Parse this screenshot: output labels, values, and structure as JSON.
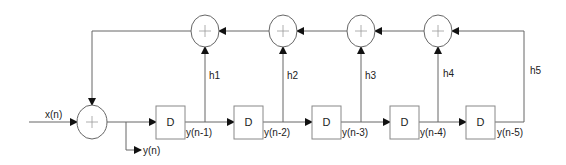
{
  "diagram": {
    "type": "IIR filter block diagram (direct form, 5-tap feedback)",
    "input_label": "x(n)",
    "output_label": "y(n)",
    "delay_label": "D",
    "delays": [
      {
        "label": "D",
        "output": "y(n-1)"
      },
      {
        "label": "D",
        "output": "y(n-2)"
      },
      {
        "label": "D",
        "output": "y(n-3)"
      },
      {
        "label": "D",
        "output": "y(n-4)"
      },
      {
        "label": "D",
        "output": "y(n-5)"
      }
    ],
    "coefficients": [
      "h1",
      "h2",
      "h3",
      "h4",
      "h5"
    ],
    "summer_symbol": "+",
    "colors": {
      "line": "#555555",
      "box_stroke": "#777777",
      "text": "#222222",
      "background": "#ffffff"
    }
  }
}
